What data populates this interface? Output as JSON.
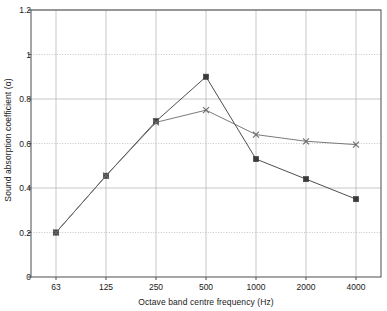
{
  "chart_data": {
    "type": "line",
    "title": "",
    "xlabel": "Octave band centre frequency (Hz)",
    "ylabel": "Sound absorption coefficient (α)",
    "categories": [
      "63",
      "125",
      "250",
      "500",
      "1000",
      "2000",
      "4000"
    ],
    "x_tick_labels": [
      "63",
      "125",
      "250",
      "500",
      "1000",
      "2000",
      "4000"
    ],
    "y_tick_labels": [
      "0",
      "0.2",
      "0.4",
      "0.6",
      "0.8",
      "1",
      "1.2"
    ],
    "y_tick_values": [
      0,
      0.2,
      0.4,
      0.6,
      0.8,
      1,
      1.2
    ],
    "ylim": [
      0,
      1.2
    ],
    "grid": true,
    "legend": "none",
    "series": [
      {
        "name": "series-square",
        "marker": "square",
        "color": "#3a3a3a",
        "values": [
          0.2,
          0.455,
          0.7,
          0.9,
          0.53,
          0.44,
          0.35
        ]
      },
      {
        "name": "series-cross",
        "marker": "cross",
        "color": "#6b6b6b",
        "values": [
          0.2,
          0.455,
          0.695,
          0.75,
          0.64,
          0.61,
          0.595
        ]
      }
    ]
  },
  "colors": {
    "axis": "#4d4d4d",
    "grid": "#b9b9b9",
    "text": "#1a1a1a",
    "background": "#ffffff"
  }
}
